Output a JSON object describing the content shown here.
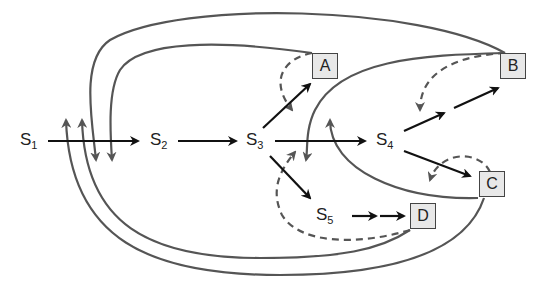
{
  "diagram": {
    "states": [
      {
        "id": "S1",
        "base": "S",
        "sub": "1"
      },
      {
        "id": "S2",
        "base": "S",
        "sub": "2"
      },
      {
        "id": "S3",
        "base": "S",
        "sub": "3"
      },
      {
        "id": "S4",
        "base": "S",
        "sub": "4"
      },
      {
        "id": "S5",
        "base": "S",
        "sub": "5"
      }
    ],
    "outcomes": [
      {
        "id": "A",
        "label": "A"
      },
      {
        "id": "B",
        "label": "B"
      },
      {
        "id": "C",
        "label": "C"
      },
      {
        "id": "D",
        "label": "D"
      }
    ],
    "edges": {
      "solid_black": [
        "S1->S2",
        "S2->S3",
        "S3->S4",
        "S3->A",
        "S3->S5",
        "S4->B",
        "S4->C",
        "S5->D"
      ],
      "solid_gray_feedback": [
        "A->S2",
        "B->S2",
        "B->S3",
        "C->S4",
        "C->S1",
        "D->S1"
      ],
      "dashed_gray_feedback": [
        "A->S3",
        "B->S4",
        "C->S4",
        "D->S3"
      ]
    },
    "colors": {
      "primary_arrow": "#111111",
      "feedback_line": "#555555",
      "box_fill": "#e8e8e8",
      "box_border": "#444444"
    }
  }
}
